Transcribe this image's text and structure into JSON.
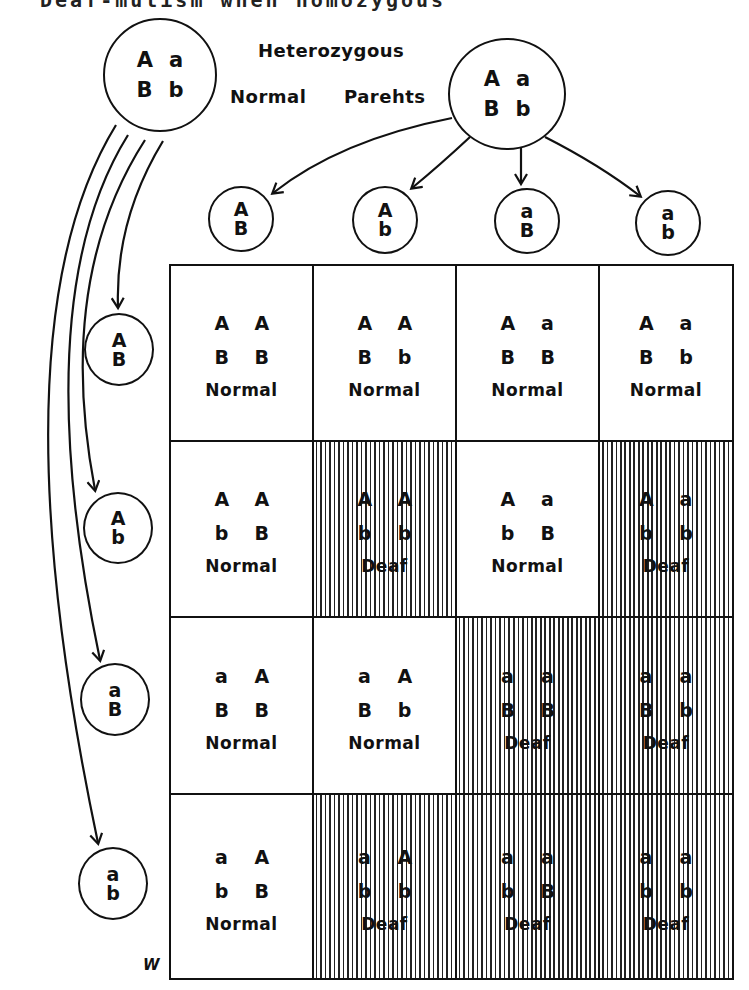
{
  "title": "Deaf-mutism when homozygous",
  "labels": {
    "heterozygous": "Heterozygous",
    "normal": "Normal",
    "parents": "Parehts"
  },
  "parents": [
    {
      "name": "left-parent",
      "genotype": [
        [
          "A",
          "a"
        ],
        [
          "B",
          "b"
        ]
      ]
    },
    {
      "name": "right-parent",
      "genotype": [
        [
          "A",
          "a"
        ],
        [
          "B",
          "b"
        ]
      ]
    }
  ],
  "gametes_top": [
    {
      "top": "A",
      "bottom": "B"
    },
    {
      "top": "A",
      "bottom": "b"
    },
    {
      "top": "a",
      "bottom": "B"
    },
    {
      "top": "a",
      "bottom": "b"
    }
  ],
  "gametes_left": [
    {
      "top": "A",
      "bottom": "B"
    },
    {
      "top": "A",
      "bottom": "b"
    },
    {
      "top": "a",
      "bottom": "B"
    },
    {
      "top": "a",
      "bottom": "b"
    }
  ],
  "grid": [
    [
      {
        "g1": [
          "A",
          "A"
        ],
        "g2": [
          "B",
          "B"
        ],
        "phenotype": "Normal",
        "deaf": false
      },
      {
        "g1": [
          "A",
          "A"
        ],
        "g2": [
          "B",
          "b"
        ],
        "phenotype": "Normal",
        "deaf": false
      },
      {
        "g1": [
          "A",
          "a"
        ],
        "g2": [
          "B",
          "B"
        ],
        "phenotype": "Normal",
        "deaf": false
      },
      {
        "g1": [
          "A",
          "a"
        ],
        "g2": [
          "B",
          "b"
        ],
        "phenotype": "Normal",
        "deaf": false
      }
    ],
    [
      {
        "g1": [
          "A",
          "A"
        ],
        "g2": [
          "b",
          "B"
        ],
        "phenotype": "Normal",
        "deaf": false
      },
      {
        "g1": [
          "A",
          "A"
        ],
        "g2": [
          "b",
          "b"
        ],
        "phenotype": "Deaf",
        "deaf": true
      },
      {
        "g1": [
          "A",
          "a"
        ],
        "g2": [
          "b",
          "B"
        ],
        "phenotype": "Normal",
        "deaf": false
      },
      {
        "g1": [
          "A",
          "a"
        ],
        "g2": [
          "b",
          "b"
        ],
        "phenotype": "Deaf",
        "deaf": true
      }
    ],
    [
      {
        "g1": [
          "a",
          "A"
        ],
        "g2": [
          "B",
          "B"
        ],
        "phenotype": "Normal",
        "deaf": false
      },
      {
        "g1": [
          "a",
          "A"
        ],
        "g2": [
          "B",
          "b"
        ],
        "phenotype": "Normal",
        "deaf": false
      },
      {
        "g1": [
          "a",
          "a"
        ],
        "g2": [
          "B",
          "B"
        ],
        "phenotype": "Deaf",
        "deaf": true
      },
      {
        "g1": [
          "a",
          "a"
        ],
        "g2": [
          "B",
          "b"
        ],
        "phenotype": "Deaf",
        "deaf": true
      }
    ],
    [
      {
        "g1": [
          "a",
          "A"
        ],
        "g2": [
          "b",
          "B"
        ],
        "phenotype": "Normal",
        "deaf": false
      },
      {
        "g1": [
          "a",
          "A"
        ],
        "g2": [
          "b",
          "b"
        ],
        "phenotype": "Deaf",
        "deaf": true
      },
      {
        "g1": [
          "a",
          "a"
        ],
        "g2": [
          "b",
          "B"
        ],
        "phenotype": "Deaf",
        "deaf": true
      },
      {
        "g1": [
          "a",
          "a"
        ],
        "g2": [
          "b",
          "b"
        ],
        "phenotype": "Deaf",
        "deaf": true
      }
    ]
  ],
  "signature": "W",
  "colors": {
    "line": "#111111",
    "hatch": "#222222",
    "background": "#ffffff"
  }
}
